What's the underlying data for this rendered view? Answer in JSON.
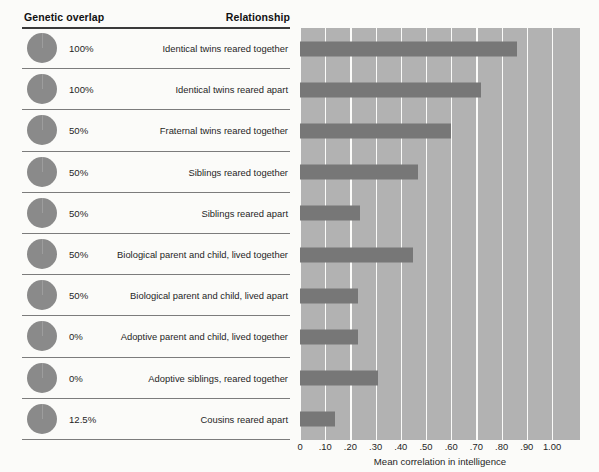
{
  "figure": {
    "headers": {
      "genetic_overlap": "Genetic overlap",
      "relationship": "Relationship"
    },
    "colors": {
      "bar": "#777777",
      "plot_background": "#b2b2b2",
      "gridline": "#fbfbf9",
      "pie_fill": "#8a8a8a",
      "rule": "#3a3a3a"
    }
  },
  "chart_data": {
    "type": "bar",
    "orientation": "horizontal",
    "title": "",
    "xlabel": "Mean correlation in intelligence",
    "ylabel": "",
    "xlim": [
      0,
      1.0
    ],
    "grid": true,
    "legend": "none",
    "tick_labels": [
      "0",
      ".10",
      ".20",
      ".30",
      ".40",
      ".50",
      ".60",
      ".70",
      ".80",
      ".90",
      "1.00"
    ],
    "tick_values": [
      0,
      0.1,
      0.2,
      0.3,
      0.4,
      0.5,
      0.6,
      0.7,
      0.8,
      0.9,
      1.0
    ],
    "categories": [
      "Identical twins reared together",
      "Identical twins reared apart",
      "Fraternal twins reared together",
      "Siblings reared together",
      "Siblings reared apart",
      "Biological parent and child, lived together",
      "Biological parent and child, lived apart",
      "Adoptive parent and child, lived together",
      "Adoptive siblings, reared together",
      "Cousins reared apart"
    ],
    "values": [
      0.86,
      0.72,
      0.6,
      0.47,
      0.24,
      0.45,
      0.23,
      0.23,
      0.31,
      0.14
    ],
    "genetic_overlap_labels": [
      "100%",
      "100%",
      "50%",
      "50%",
      "50%",
      "50%",
      "50%",
      "0%",
      "0%",
      "12.5%"
    ],
    "genetic_overlap_values": [
      100,
      100,
      50,
      50,
      50,
      50,
      50,
      0,
      0,
      12.5
    ]
  },
  "rows": [
    {
      "pct": "100%",
      "overlap": 100,
      "relationship": "Identical twins reared together",
      "value": 0.86
    },
    {
      "pct": "100%",
      "overlap": 100,
      "relationship": "Identical twins reared apart",
      "value": 0.72
    },
    {
      "pct": "50%",
      "overlap": 50,
      "relationship": "Fraternal twins reared together",
      "value": 0.6
    },
    {
      "pct": "50%",
      "overlap": 50,
      "relationship": "Siblings reared together",
      "value": 0.47
    },
    {
      "pct": "50%",
      "overlap": 50,
      "relationship": "Siblings reared apart",
      "value": 0.24
    },
    {
      "pct": "50%",
      "overlap": 50,
      "relationship": "Biological parent and child, lived together",
      "value": 0.45
    },
    {
      "pct": "50%",
      "overlap": 50,
      "relationship": "Biological parent and child, lived apart",
      "value": 0.23
    },
    {
      "pct": "0%",
      "overlap": 0,
      "relationship": "Adoptive parent and child, lived together",
      "value": 0.23
    },
    {
      "pct": "0%",
      "overlap": 0,
      "relationship": "Adoptive siblings, reared together",
      "value": 0.31
    },
    {
      "pct": "12.5%",
      "overlap": 12.5,
      "relationship": "Cousins reared apart",
      "value": 0.14
    }
  ],
  "axis": {
    "title": "Mean correlation in intelligence"
  }
}
